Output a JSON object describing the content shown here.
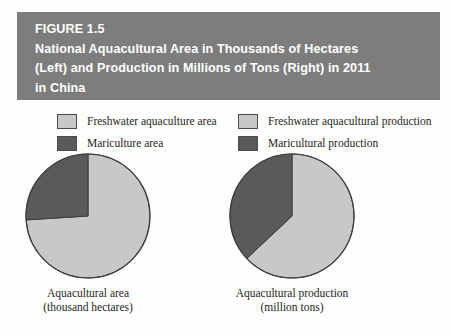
{
  "figure": {
    "label": "FIGURE 1.5",
    "title_lines": [
      "FIGURE 1.5",
      "National Aquacultural Area in Thousands of Hectares",
      "(Left) and Production in Millions of Tons (Right) in 2011",
      "in China"
    ],
    "banner_color": "#7d7d7d",
    "banner_text_color": "#ffffff"
  },
  "legend": {
    "left_column": [
      {
        "label": "Freshwater aquaculture area",
        "color": "#c8c8c8",
        "swatch": "light-gray-swatch"
      },
      {
        "label": "Mariculture area",
        "color": "#5a5a5a",
        "swatch": "dark-gray-swatch"
      }
    ],
    "right_column": [
      {
        "label": "Freshwater aquacultural production",
        "color": "#c8c8c8",
        "swatch": "light-gray-swatch"
      },
      {
        "label": "Maricultural production",
        "color": "#5a5a5a",
        "swatch": "dark-gray-swatch"
      }
    ]
  },
  "captions": {
    "left_line1": "Aquacultural area",
    "left_line2": "(thousand hectares)",
    "right_line1": "Aquacultural production",
    "right_line2": "(million tons)"
  },
  "chart_data": [
    {
      "type": "pie",
      "title": "Aquacultural area",
      "subtitle": "(thousand hectares)",
      "categories": [
        "Freshwater aquaculture area",
        "Mariculture area"
      ],
      "values": [
        74,
        26
      ],
      "unit": "percent",
      "colors": [
        "#c8c8c8",
        "#5a5a5a"
      ],
      "start_angle_deg": 0,
      "direction": "clockwise",
      "legend_position": "top"
    },
    {
      "type": "pie",
      "title": "Aquacultural production",
      "subtitle": "(million tons)",
      "categories": [
        "Freshwater aquacultural production",
        "Maricultural production"
      ],
      "values": [
        63,
        37
      ],
      "unit": "percent",
      "colors": [
        "#c8c8c8",
        "#5a5a5a"
      ],
      "start_angle_deg": 0,
      "direction": "clockwise",
      "legend_position": "top"
    }
  ]
}
